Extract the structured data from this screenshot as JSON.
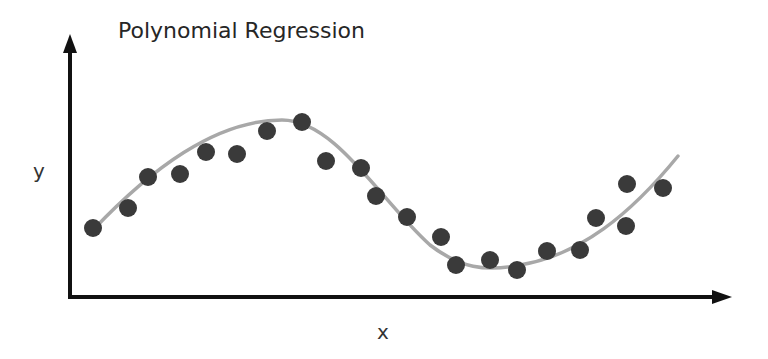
{
  "chart_data": {
    "type": "scatter",
    "title": "Polynomial Regression",
    "xlabel": "x",
    "ylabel": "y",
    "grid": false,
    "legend": null,
    "ticks": "none",
    "colors": {
      "points": "#3a3a3a",
      "curve": "#a8a8a8",
      "axes": "#111111",
      "text": "#262626"
    },
    "points_px": [
      [
        93,
        228
      ],
      [
        128,
        208
      ],
      [
        148,
        177
      ],
      [
        180,
        174
      ],
      [
        206,
        152
      ],
      [
        237,
        154
      ],
      [
        267,
        131
      ],
      [
        302,
        122
      ],
      [
        326,
        161
      ],
      [
        361,
        168
      ],
      [
        376,
        196
      ],
      [
        407,
        217
      ],
      [
        441,
        237
      ],
      [
        456,
        265
      ],
      [
        490,
        260
      ],
      [
        517,
        270
      ],
      [
        547,
        251
      ],
      [
        580,
        250
      ],
      [
        596,
        218
      ],
      [
        627,
        184
      ],
      [
        626,
        226
      ],
      [
        663,
        188
      ]
    ],
    "series": [
      {
        "name": "data",
        "kind": "scatter",
        "x": [
          0.04,
          0.09,
          0.12,
          0.17,
          0.21,
          0.25,
          0.3,
          0.35,
          0.39,
          0.44,
          0.47,
          0.51,
          0.56,
          0.58,
          0.63,
          0.67,
          0.72,
          0.77,
          0.79,
          0.84,
          0.84,
          0.89
        ],
        "y": [
          0.27,
          0.34,
          0.46,
          0.47,
          0.55,
          0.55,
          0.64,
          0.67,
          0.52,
          0.5,
          0.39,
          0.31,
          0.24,
          0.13,
          0.15,
          0.11,
          0.19,
          0.19,
          0.31,
          0.44,
          0.28,
          0.43
        ]
      },
      {
        "name": "polynomial fit",
        "kind": "line",
        "description": "cubic-like smooth curve rising to a peak near x≈0.32, falling to a trough near x≈0.63, then rising again",
        "curve_px": "M93,230 C150,170 215,120 282,120 C335,120 380,200 430,245 C460,268 485,272 520,265 C580,255 630,215 678,156"
      }
    ],
    "xlim": [
      0,
      1
    ],
    "ylim": [
      0,
      1
    ]
  }
}
